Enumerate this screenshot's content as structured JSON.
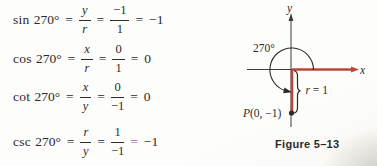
{
  "colors": {
    "red": "#b9473a",
    "purple": "#9e5f9b",
    "ink": "#2b2b2b"
  },
  "symbols": {
    "equals": "="
  },
  "equations": [
    {
      "fn": "sin",
      "angle": "270°",
      "num1": "y",
      "den1": "r",
      "num2": "−1",
      "den2": "1",
      "result": "−1"
    },
    {
      "fn": "cos",
      "angle": "270°",
      "num1": "x",
      "den1": "r",
      "num2": "0",
      "den2": "1",
      "result": "0"
    },
    {
      "fn": "cot",
      "angle": "270°",
      "num1": "x",
      "den1": "y",
      "num2": "0",
      "den2": "−1",
      "result": "0"
    },
    {
      "fn": "csc",
      "angle": "270°",
      "num1": "r",
      "den1": "y",
      "num2": "1",
      "den2": "−1",
      "result": "−1"
    }
  ],
  "figure": {
    "y_label": "y",
    "x_label": "x",
    "angle_label": "270°",
    "point_p": "P",
    "point_coords": "(0, −1)",
    "radius_var": "r",
    "radius_value": " = 1",
    "caption": "Figure 5–13"
  }
}
